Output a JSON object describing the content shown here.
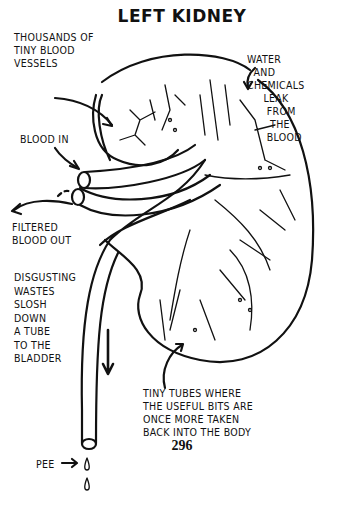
{
  "title": "LEFT KIDNEY",
  "labels": {
    "vessels": "THOUSANDS OF\nTINY BLOOD\nVESSELS",
    "water": "WATER\n  AND\nCHEMICALS\n     LEAK\n      FROM\n       THE\n      BLOOD",
    "blood_in": "BLOOD IN",
    "filtered": "FILTERED\nBLOOD OUT",
    "wastes": "DISGUSTING\nWASTES\nSLOSH\nDOWN\nA TUBE\nTO THE\nBLADDER",
    "tubes": "TINY TUBES WHERE\nTHE USEFUL BITS ARE\nONCE MORE TAKEN\nBACK INTO THE BODY",
    "pee": "PEE"
  },
  "page_number": "296"
}
